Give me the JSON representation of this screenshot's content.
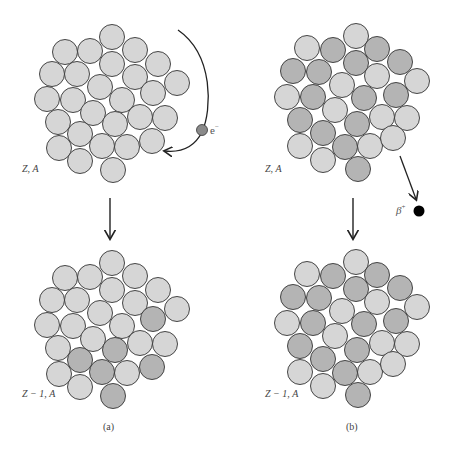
{
  "figure": {
    "colors": {
      "light_nucleon": "#d6d6d6",
      "dark_nucleon": "#b4b4b4",
      "outline": "#333333",
      "electron": "#8a8a8a",
      "positron": "#000000",
      "arrow": "#222222"
    },
    "nucleon_radius": 12.5,
    "panel_a": {
      "caption": "(a)",
      "initial_label": "Z, A",
      "final_label": "Z − 1, A",
      "particle_label": "e",
      "particle_charge": "−",
      "process": "electron capture"
    },
    "panel_b": {
      "caption": "(b)",
      "initial_label": "Z, A",
      "final_label": "Z − 1, A",
      "particle_label": "β",
      "particle_charge": "+",
      "process": "positron emission"
    }
  }
}
